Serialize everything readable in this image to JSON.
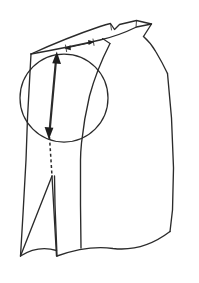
{
  "figure": {
    "background_color": "#ffffff",
    "ink_color": "#2b2b2b",
    "canvas": {
      "width": 199,
      "height": 283
    },
    "labels": {
      "none_visible": ""
    }
  },
  "drawing": {
    "body_outline": {
      "name": "bodice-front-outline",
      "path": "M 31 54 L 27 118 L 26 160 L 23 214 L 20 256 L 27 262 Q 60 248 80 256 L 81 206 L 80 160 Q 83 120 90 96 Q 100 68 110 44 L 136 26 L 137 33 L 151 25 L 143 37 Q 152 44 158 57 L 168 76 L 172 120 L 174 170 L 172 212 L 170 232 L 133 240 Q 110 245 92 254 Q 84 258 80 256"
    },
    "shoulder_upper_edge": {
      "name": "shoulder-upper-edge",
      "path": "M 31 54 Q 70 38 104 26 L 136 26"
    },
    "shoulder_lower_edge": {
      "name": "shoulder-lower-edge",
      "path": "M 31 54 Q 72 46 104 38 Q 118 34 136 26"
    },
    "shoulder_notch": {
      "name": "shoulder-notch-point",
      "path": "M 110 24 L 114 30 L 119 25"
    },
    "shoulder_tip": {
      "name": "shoulder-tip-wedge",
      "path": "M 136 26 L 151 25 L 143 37 L 136 26"
    },
    "neckline_curve": {
      "name": "neckline-curve",
      "path": "M 143 37 Q 152 45 158 58 Q 164 68 169 76"
    },
    "armhole_seam": {
      "name": "armhole-seam-line",
      "path": "M 110 44 Q 96 72 89 98 Q 83 122 81 145 Q 80 154 80 160"
    },
    "side_inner_line": {
      "name": "side-inner-seam",
      "path": "M 31 54 L 27 118 L 26 160 L 23 214 L 20 256"
    },
    "dart_wedge": {
      "name": "bottom-dart-wedge",
      "path": "M 20 256 L 51 176 L 56 256"
    },
    "hem_curve_left": {
      "name": "hem-curve-left",
      "path": "M 20 256 Q 38 246 56 250"
    },
    "hem_curve_right": {
      "name": "hem-curve-right",
      "path": "M 56 256 Q 88 244 112 248 Q 142 252 170 232"
    },
    "center_panel_line": {
      "name": "center-panel-line",
      "path": "M 81 206 L 80 160"
    },
    "side_outer_line": {
      "name": "side-outer-line",
      "path": "M 169 76 L 172 120 L 174 170 L 172 212 L 170 232"
    }
  },
  "annotations": {
    "emphasis_circle": {
      "name": "emphasis-circle",
      "center_x": 64,
      "center_y": 98,
      "radius": 44,
      "note": "circle highlighting shoulder-to-bust adjustment zone"
    },
    "measure_arrow": {
      "name": "vertical-double-arrow",
      "x1": 56,
      "y1": 54,
      "x2": 49,
      "y2": 137,
      "style": "double-headed",
      "note": "shoulder point to bust point measurement"
    },
    "guide_line": {
      "name": "vertical-dashed-guide",
      "x1": 49,
      "y1": 137,
      "x2": 51,
      "y2": 176,
      "style": "dashed",
      "note": "continuation guideline down to dart apex"
    },
    "shoulder_measure": {
      "name": "shoulder-horizontal-double-arrow",
      "x1": 67,
      "y1": 48,
      "x2": 92,
      "y2": 42,
      "style": "double-headed",
      "note": "small horizontal shoulder width adjustment marker"
    }
  }
}
